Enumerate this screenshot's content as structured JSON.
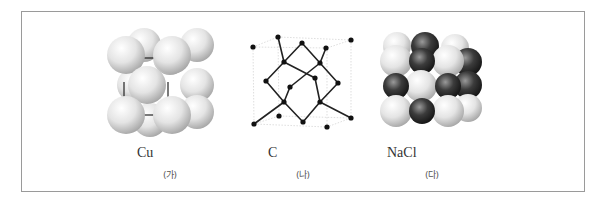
{
  "figures": [
    {
      "id": "ga",
      "formula": "Cu",
      "tag": "(가)",
      "structure": "face-centered cubic (metallic)"
    },
    {
      "id": "na",
      "formula": "C",
      "tag": "(나)",
      "structure": "diamond covalent network"
    },
    {
      "id": "da",
      "formula": "NaCl",
      "tag": "(다)",
      "structure": "rock-salt ionic lattice"
    }
  ],
  "colors": {
    "frame": "#9a9a9a",
    "light_sphere": "#e6e6e6",
    "dark_sphere": "#3a3a3a",
    "atom": "#111111",
    "bond": "#222222"
  }
}
